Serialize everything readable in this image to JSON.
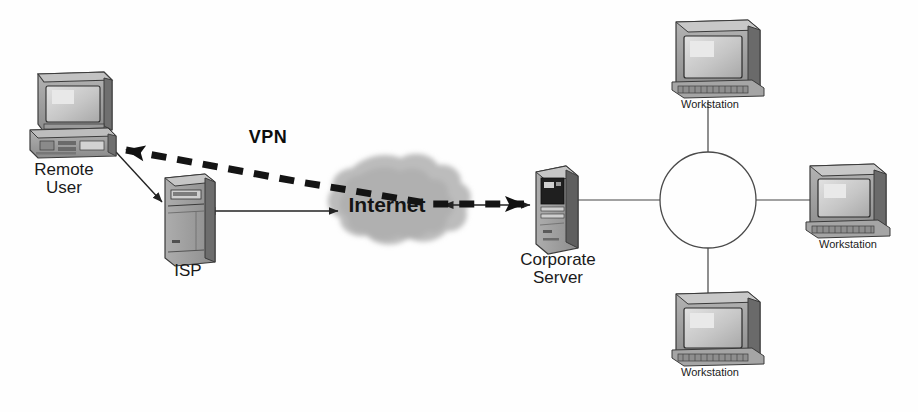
{
  "diagram": {
    "background_color": "#fefefe",
    "line_color": "#2b2b2b",
    "cloud_color": "#b7b7b7",
    "device_color": "#8f8f8f",
    "device_dark": "#4a4a4a",
    "screen_color": "#c9c9c9"
  },
  "nodes": {
    "remote_user": {
      "label_line1": "Remote",
      "label_line2": "User",
      "icon": "desktop-computer-icon",
      "x": 78,
      "y": 115
    },
    "isp": {
      "label": "ISP",
      "icon": "server-tower-icon",
      "x": 186,
      "y": 215
    },
    "internet": {
      "label": "Internet",
      "icon": "cloud-icon",
      "x": 387,
      "y": 205
    },
    "corporate_server": {
      "label_line1": "Corporate",
      "label_line2": "Server",
      "icon": "server-tower-icon",
      "x": 553,
      "y": 200
    },
    "ring": {
      "label": "ring-network",
      "icon": "ring-circle-icon",
      "cx": 708,
      "cy": 200,
      "r": 48
    },
    "workstation_top": {
      "label": "Workstation",
      "icon": "workstation-monitor-icon",
      "x": 714,
      "y": 60
    },
    "workstation_right": {
      "label": "Workstation",
      "icon": "workstation-monitor-icon",
      "x": 848,
      "y": 205
    },
    "workstation_bottom": {
      "label": "Workstation",
      "icon": "workstation-monitor-icon",
      "x": 714,
      "y": 330
    }
  },
  "connections": {
    "vpn_tunnel": {
      "label": "VPN",
      "style": "thick-dashed",
      "from": "remote_user",
      "to": "corporate_server",
      "arrow": "both"
    },
    "remote_to_isp": {
      "style": "thin-solid",
      "from": "remote_user",
      "to": "isp",
      "arrow": "to-isp"
    },
    "isp_to_internet": {
      "style": "thin-solid",
      "from": "isp",
      "to": "internet",
      "arrow": "both"
    },
    "internet_to_server": {
      "style": "thin-solid",
      "from": "internet",
      "to": "corporate_server",
      "arrow": "both"
    },
    "server_to_ring": {
      "style": "thin-solid",
      "from": "corporate_server",
      "to": "ring",
      "arrow": "none"
    },
    "ring_to_workstation_top": {
      "style": "thin-solid",
      "from": "ring",
      "to": "workstation_top",
      "arrow": "none"
    },
    "ring_to_workstation_right": {
      "style": "thin-solid",
      "from": "ring",
      "to": "workstation_right",
      "arrow": "none"
    },
    "ring_to_workstation_bottom": {
      "style": "thin-solid",
      "from": "ring",
      "to": "workstation_bottom",
      "arrow": "none"
    }
  }
}
